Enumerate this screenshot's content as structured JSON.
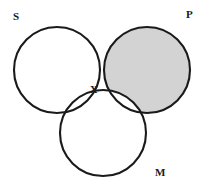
{
  "figure": {
    "name": "three-circle-venn-diagram",
    "width": 205,
    "height": 189,
    "background_color": "#ffffff"
  },
  "style": {
    "stroke_color": "#1a1a1a",
    "stroke_width": 2.1,
    "shade_color": "#d3d3d3",
    "fill_color": "#ffffff",
    "label_color": "#1a1a1a"
  },
  "circles": [
    {
      "id": "s",
      "label": "S",
      "cx": 57,
      "cy": 70,
      "r": 43
    },
    {
      "id": "p",
      "label": "P",
      "cx": 147,
      "cy": 70,
      "r": 43
    },
    {
      "id": "m",
      "label": "M",
      "cx": 103,
      "cy": 133,
      "r": 43
    }
  ],
  "labels": {
    "set_s": "S",
    "set_p": "P",
    "set_m": "M",
    "member_x": "X"
  },
  "shading": {
    "description": "P circle shaded except where it overlaps M",
    "shaded_region": "P minus M",
    "color": "#d3d3d3"
  },
  "markers": [
    {
      "id": "x",
      "label": "X",
      "x": 94,
      "y": 91,
      "region": "S and M, outside P"
    }
  ]
}
